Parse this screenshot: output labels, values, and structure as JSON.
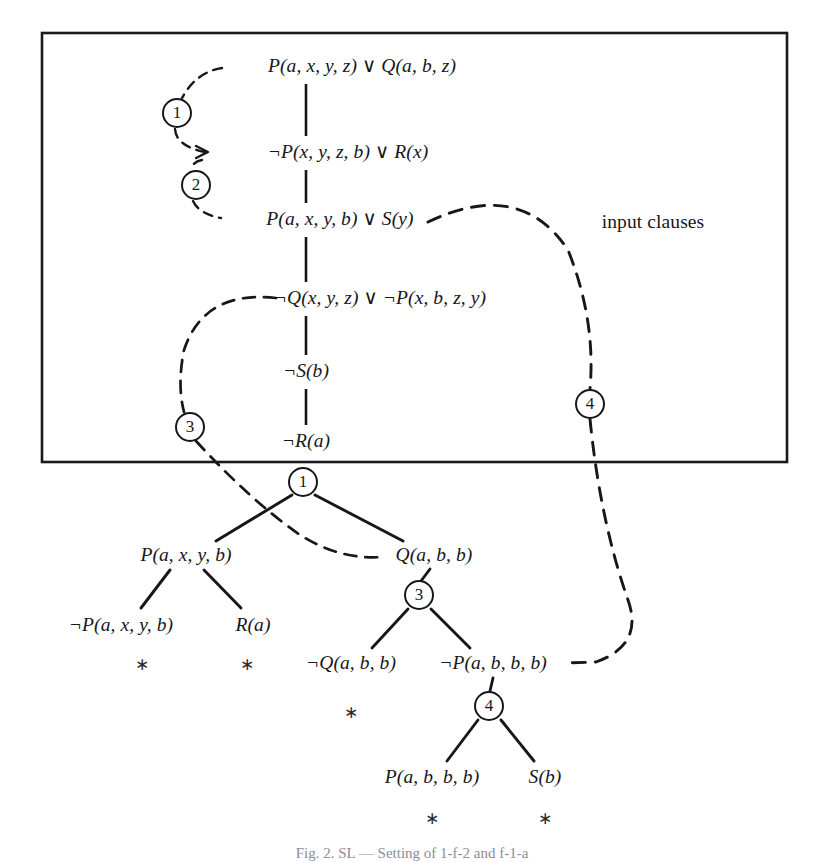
{
  "figure": {
    "caption": "Fig. 2. SL — Setting of 1-f-2 and f-1-a",
    "region_label": "input clauses",
    "box": {
      "x": 42,
      "y": 33,
      "width": 745,
      "height": 429
    }
  },
  "input_clauses": [
    {
      "id": "c1",
      "text": "P(a, x, y, z) ∨ Q(a, b, z)",
      "x": 362,
      "y": 66
    },
    {
      "id": "c2",
      "text": "¬P(x, y, z, b) ∨ R(x)",
      "x": 348,
      "y": 152
    },
    {
      "id": "c3",
      "text": "P(a, x, y, b) ∨ S(y)",
      "x": 340,
      "y": 219
    },
    {
      "id": "c4",
      "text": "¬Q(x, y, z) ∨ ¬P(x, b, z, y)",
      "x": 380,
      "y": 298
    },
    {
      "id": "c5",
      "text": "¬S(b)",
      "x": 306,
      "y": 371
    },
    {
      "id": "c6",
      "text": "¬R(a)",
      "x": 306,
      "y": 441
    }
  ],
  "input_links": [
    {
      "id": "l1",
      "label": "1",
      "cx": 177,
      "cy": 113,
      "r": 15
    },
    {
      "id": "l2",
      "label": "2",
      "cx": 196,
      "cy": 185,
      "r": 15
    },
    {
      "id": "l3",
      "label": "3",
      "cx": 190,
      "cy": 427,
      "r": 15
    },
    {
      "id": "l4",
      "label": "4",
      "cx": 590,
      "cy": 404,
      "r": 15
    }
  ],
  "tree_nodes": [
    {
      "id": "t1",
      "label": "1",
      "cx": 303,
      "cy": 482,
      "r": 15
    },
    {
      "id": "t3",
      "label": "3",
      "cx": 419,
      "cy": 595,
      "r": 15
    },
    {
      "id": "t4",
      "label": "4",
      "cx": 489,
      "cy": 706,
      "r": 15
    }
  ],
  "tree_labels": [
    {
      "id": "n1",
      "text": "P(a, x, y, b)",
      "x": 186,
      "y": 555
    },
    {
      "id": "n2",
      "text": "Q(a, b, b)",
      "x": 434,
      "y": 555
    },
    {
      "id": "n3",
      "text": "¬P(a, x, y, b)",
      "x": 121,
      "y": 625
    },
    {
      "id": "n4",
      "text": "R(a)",
      "x": 253,
      "y": 625
    },
    {
      "id": "n5",
      "text": "¬Q(a, b, b)",
      "x": 351,
      "y": 663
    },
    {
      "id": "n6",
      "text": "¬P(a, b, b, b)",
      "x": 493,
      "y": 663
    },
    {
      "id": "n7",
      "text": "P(a, b, b, b)",
      "x": 432,
      "y": 777
    },
    {
      "id": "n8",
      "text": "S(b)",
      "x": 545,
      "y": 777
    }
  ],
  "closure_marks": [
    {
      "id": "s1",
      "glyph": "∗",
      "x": 142,
      "y": 664
    },
    {
      "id": "s2",
      "glyph": "∗",
      "x": 247,
      "y": 664
    },
    {
      "id": "s3",
      "glyph": "∗",
      "x": 351,
      "y": 712
    },
    {
      "id": "s4",
      "glyph": "∗",
      "x": 432,
      "y": 818
    },
    {
      "id": "s5",
      "glyph": "∗",
      "x": 545,
      "y": 818
    }
  ],
  "region_label_pos": {
    "x": 653,
    "y": 222
  },
  "colors": {
    "ink": "#17171a",
    "rule": "#1a1a1d",
    "caption": "#8d8d92"
  },
  "edges": {
    "chain": [
      {
        "id": "e-c1-c2",
        "x1": 306,
        "y1": 84,
        "x2": 306,
        "y2": 136
      },
      {
        "id": "e-c2-c3",
        "x1": 306,
        "y1": 170,
        "x2": 306,
        "y2": 203
      },
      {
        "id": "e-c3-c4",
        "x1": 306,
        "y1": 237,
        "x2": 306,
        "y2": 282
      },
      {
        "id": "e-c4-c5",
        "x1": 306,
        "y1": 316,
        "x2": 306,
        "y2": 355
      },
      {
        "id": "e-c5-c6",
        "x1": 306,
        "y1": 389,
        "x2": 306,
        "y2": 425
      }
    ],
    "tree": [
      {
        "id": "e-t1-n1",
        "x1": 293,
        "y1": 496,
        "x2": 215,
        "y2": 541
      },
      {
        "id": "e-t1-n2",
        "x1": 314,
        "y1": 496,
        "x2": 404,
        "y2": 541
      },
      {
        "id": "e-n1-n3",
        "x1": 170,
        "y1": 570,
        "x2": 140,
        "y2": 608
      },
      {
        "id": "e-n1-n4",
        "x1": 203,
        "y1": 570,
        "x2": 240,
        "y2": 608
      },
      {
        "id": "e-n2-t3",
        "x1": 429,
        "y1": 570,
        "x2": 419,
        "y2": 581
      },
      {
        "id": "e-t3-n5",
        "x1": 408,
        "y1": 609,
        "x2": 371,
        "y2": 648
      },
      {
        "id": "e-t3-n6",
        "x1": 431,
        "y1": 609,
        "x2": 469,
        "y2": 648
      },
      {
        "id": "e-n6-t4",
        "x1": 493,
        "y1": 678,
        "x2": 489,
        "y2": 692
      },
      {
        "id": "e-t4-n7",
        "x1": 478,
        "y1": 720,
        "x2": 446,
        "y2": 761
      },
      {
        "id": "e-t4-n8",
        "x1": 501,
        "y1": 720,
        "x2": 533,
        "y2": 761
      }
    ]
  }
}
